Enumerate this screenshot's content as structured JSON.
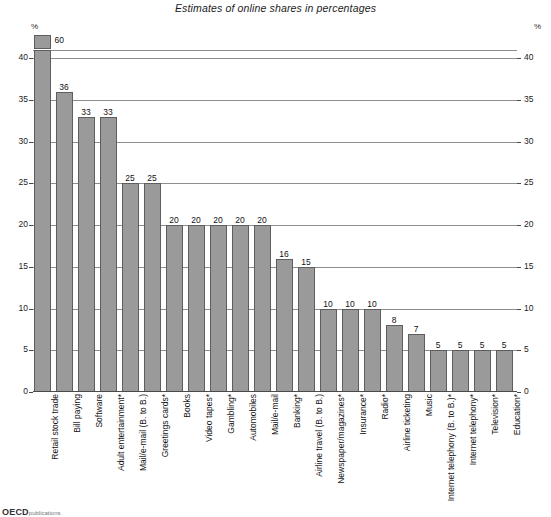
{
  "chart_data": {
    "type": "bar",
    "title": "Estimates of online shares in percentages",
    "xlabel": "",
    "ylabel": "%",
    "ylim": [
      0,
      41
    ],
    "yticks": [
      0,
      5,
      10,
      15,
      20,
      25,
      30,
      35,
      40
    ],
    "grid": true,
    "legend": null,
    "axis_break": {
      "present": true,
      "note": "First bar (Retail stock trade, 60) exceeds the axis and is drawn as a stub above the top rule"
    },
    "unit_left": "%",
    "unit_right": "%",
    "categories": [
      "Retail stock trade",
      "Bill paying",
      "Software",
      "Adult entertainment*",
      "Mail/e-mail (B. to B.)",
      "Greetings cards*",
      "Books",
      "Video tapes*",
      "Gambling*",
      "Automobiles",
      "Mail/e-mail",
      "Banking*",
      "Airline travel (B. to B.)",
      "Newspaper/magazines*",
      "Insurance*",
      "Radio*",
      "Airline ticketing",
      "Music",
      "Internet telephony (B. to B.)*",
      "Internet telephony*",
      "Television*",
      "Education*"
    ],
    "values": [
      60,
      36,
      33,
      33,
      25,
      25,
      20,
      20,
      20,
      20,
      20,
      16,
      15,
      10,
      10,
      10,
      8,
      7,
      5,
      5,
      5,
      5
    ]
  },
  "footer": {
    "mark": "OECD",
    "mark_sub": "publications"
  },
  "colors": {
    "bar_fill": "#9a9a9a",
    "bar_stroke": "#5e5e5e",
    "gridline": "#8d8d8d",
    "axis": "#4a4a4a",
    "text": "#1a1a1a",
    "background": "#ffffff"
  }
}
